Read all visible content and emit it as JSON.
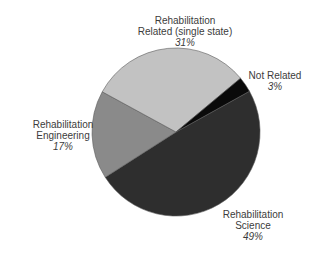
{
  "chart_data": {
    "type": "pie",
    "title": "",
    "start_angle_deg": 61,
    "direction": "clockwise",
    "slices": [
      {
        "key": "science",
        "label_lines": [
          "Rehabilitation",
          "Science"
        ],
        "label": "Rehabilitation Science",
        "value": 49,
        "pct_label": "49%",
        "color": "#2e2e2e"
      },
      {
        "key": "engineering",
        "label_lines": [
          "Rehabilitation",
          "Engineering"
        ],
        "label": "Rehabilitation Engineering",
        "value": 17,
        "pct_label": "17%",
        "color": "#8a8a8a"
      },
      {
        "key": "related",
        "label_lines": [
          "Rehabilitation",
          "Related (single state)"
        ],
        "label": "Rehabilitation Related (single state)",
        "value": 31,
        "pct_label": "31%",
        "color": "#c2c2c2"
      },
      {
        "key": "notrelated",
        "label_lines": [
          "Not Related"
        ],
        "label": "Not Related",
        "value": 3,
        "pct_label": "3%",
        "color": "#0a0a0a"
      }
    ],
    "legend": "none (direct labels)",
    "edge_color": "#5a5a5a"
  },
  "labels": {
    "related": {
      "line1": "Rehabilitation",
      "line2": "Related (single state)",
      "pct": "31%"
    },
    "notrelated": {
      "line1": "Not Related",
      "pct": "3%"
    },
    "engineering": {
      "line1": "Rehabilitation",
      "line2": "Engineering",
      "pct": "17%"
    },
    "science": {
      "line1": "Rehabilitation",
      "line2": "Science",
      "pct": "49%"
    }
  },
  "geometry": {
    "cx": 176,
    "cy": 132,
    "r": 84
  }
}
